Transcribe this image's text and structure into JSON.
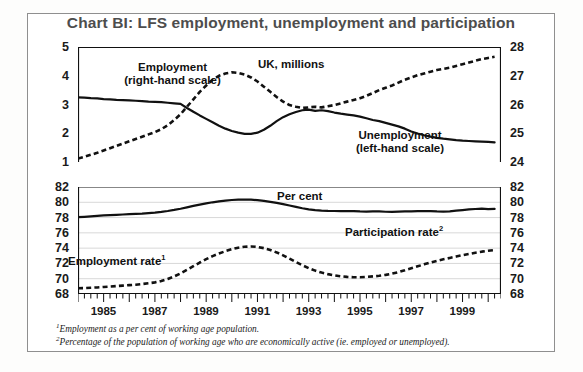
{
  "chart_title": "Chart BI: LFS employment, unemployment and participation",
  "panels": {
    "top": {
      "unit_label": "UK, millions",
      "series_labels": {
        "employment_line1": "Employment",
        "employment_line2": "(right-hand scale)",
        "unemployment_line1": "Unemployment",
        "unemployment_line2": "(left-hand scale)"
      },
      "left_ticks": [
        "5",
        "4",
        "3",
        "2",
        "1"
      ],
      "right_ticks": [
        "28",
        "27",
        "26",
        "25",
        "24"
      ]
    },
    "bottom": {
      "unit_label": "Per cent",
      "series_labels": {
        "participation": "Participation rate",
        "participation_sup": "2",
        "employment_rate": "Employment rate",
        "employment_rate_sup": "1"
      },
      "left_ticks": [
        "82",
        "80",
        "78",
        "76",
        "74",
        "72",
        "70",
        "68"
      ],
      "right_ticks": [
        "82",
        "80",
        "78",
        "76",
        "74",
        "72",
        "70",
        "68"
      ]
    }
  },
  "x_axis": {
    "tick_labels": [
      "1985",
      "1987",
      "1989",
      "1991",
      "1993",
      "1995",
      "1997",
      "1999"
    ],
    "range_start": 1984.0,
    "range_end": 2000.5,
    "minor_tick_interval_years": 0.25
  },
  "footnotes": [
    {
      "marker": "1",
      "text": "Employment as a per cent of working age population."
    },
    {
      "marker": "2",
      "text": "Percentage of the population of working age who are economically active (ie. employed or unemployed)."
    }
  ],
  "colors": {
    "line": "#111111",
    "frame": "#8f8f8f",
    "grid": "#d8d8d8",
    "title": "#4d4d4d",
    "background": "#ffffff"
  },
  "chart_data": [
    {
      "type": "line",
      "title": "LFS unemployment and employment (UK, millions)",
      "xlabel": "",
      "ylabel": "UK, millions",
      "ylim": [
        1,
        5
      ],
      "y2lim": [
        24,
        28
      ],
      "grid": false,
      "legend": "inline annotations",
      "x": [
        1984.0,
        1984.25,
        1984.5,
        1984.75,
        1985.0,
        1985.25,
        1985.5,
        1985.75,
        1986.0,
        1986.25,
        1986.5,
        1986.75,
        1987.0,
        1987.25,
        1987.5,
        1987.75,
        1988.0,
        1988.25,
        1988.5,
        1988.75,
        1989.0,
        1989.25,
        1989.5,
        1989.75,
        1990.0,
        1990.25,
        1990.5,
        1990.75,
        1991.0,
        1991.25,
        1991.5,
        1991.75,
        1992.0,
        1992.25,
        1992.5,
        1992.75,
        1993.0,
        1993.25,
        1993.5,
        1993.75,
        1994.0,
        1994.25,
        1994.5,
        1994.75,
        1995.0,
        1995.25,
        1995.5,
        1995.75,
        1996.0,
        1996.25,
        1996.5,
        1996.75,
        1997.0,
        1997.25,
        1997.5,
        1997.75,
        1998.0,
        1998.25,
        1998.5,
        1998.75,
        1999.0,
        1999.25,
        1999.5,
        1999.75,
        2000.0,
        2000.25
      ],
      "series": [
        {
          "name": "Unemployment (left-hand scale)",
          "style": "solid",
          "axis": "left",
          "units": "millions",
          "values": [
            3.25,
            3.24,
            3.22,
            3.21,
            3.19,
            3.18,
            3.16,
            3.15,
            3.14,
            3.13,
            3.12,
            3.1,
            3.09,
            3.08,
            3.06,
            3.04,
            3.02,
            2.88,
            2.75,
            2.62,
            2.5,
            2.38,
            2.26,
            2.16,
            2.08,
            2.02,
            1.98,
            1.98,
            2.02,
            2.12,
            2.26,
            2.42,
            2.56,
            2.66,
            2.74,
            2.8,
            2.82,
            2.78,
            2.8,
            2.77,
            2.72,
            2.68,
            2.65,
            2.62,
            2.58,
            2.52,
            2.46,
            2.42,
            2.36,
            2.3,
            2.24,
            2.16,
            2.06,
            1.99,
            1.93,
            1.88,
            1.84,
            1.81,
            1.79,
            1.76,
            1.74,
            1.73,
            1.72,
            1.71,
            1.7,
            1.68
          ]
        },
        {
          "name": "Employment (right-hand scale)",
          "style": "dashed",
          "axis": "right",
          "units": "millions",
          "values": [
            24.12,
            24.18,
            24.25,
            24.32,
            24.4,
            24.48,
            24.56,
            24.64,
            24.72,
            24.8,
            24.88,
            24.96,
            25.04,
            25.14,
            25.28,
            25.46,
            25.66,
            25.92,
            26.18,
            26.44,
            26.66,
            26.86,
            27.0,
            27.08,
            27.12,
            27.1,
            27.04,
            26.94,
            26.8,
            26.62,
            26.44,
            26.26,
            26.1,
            25.98,
            25.92,
            25.88,
            25.9,
            25.92,
            25.9,
            25.94,
            25.98,
            26.04,
            26.1,
            26.16,
            26.22,
            26.3,
            26.4,
            26.5,
            26.58,
            26.66,
            26.76,
            26.86,
            26.94,
            27.02,
            27.08,
            27.14,
            27.2,
            27.24,
            27.28,
            27.34,
            27.4,
            27.46,
            27.52,
            27.58,
            27.62,
            27.66
          ]
        }
      ]
    },
    {
      "type": "line",
      "title": "Employment rate and participation rate (per cent)",
      "xlabel": "",
      "ylabel": "Per cent",
      "ylim": [
        68,
        82
      ],
      "y2lim": [
        68,
        82
      ],
      "grid": true,
      "legend": "inline annotations",
      "x": [
        1984.0,
        1984.25,
        1984.5,
        1984.75,
        1985.0,
        1985.25,
        1985.5,
        1985.75,
        1986.0,
        1986.25,
        1986.5,
        1986.75,
        1987.0,
        1987.25,
        1987.5,
        1987.75,
        1988.0,
        1988.25,
        1988.5,
        1988.75,
        1989.0,
        1989.25,
        1989.5,
        1989.75,
        1990.0,
        1990.25,
        1990.5,
        1990.75,
        1991.0,
        1991.25,
        1991.5,
        1991.75,
        1992.0,
        1992.25,
        1992.5,
        1992.75,
        1993.0,
        1993.25,
        1993.5,
        1993.75,
        1994.0,
        1994.25,
        1994.5,
        1994.75,
        1995.0,
        1995.25,
        1995.5,
        1995.75,
        1996.0,
        1996.25,
        1996.5,
        1996.75,
        1997.0,
        1997.25,
        1997.5,
        1997.75,
        1998.0,
        1998.25,
        1998.5,
        1998.75,
        1999.0,
        1999.25,
        1999.5,
        1999.75,
        2000.0,
        2000.25
      ],
      "series": [
        {
          "name": "Participation rate",
          "style": "solid",
          "axis": "left",
          "units": "per cent",
          "values": [
            78.05,
            78.1,
            78.16,
            78.22,
            78.28,
            78.32,
            78.36,
            78.4,
            78.44,
            78.48,
            78.52,
            78.58,
            78.64,
            78.74,
            78.86,
            79.0,
            79.16,
            79.34,
            79.52,
            79.7,
            79.86,
            80.0,
            80.12,
            80.22,
            80.3,
            80.34,
            80.36,
            80.34,
            80.28,
            80.18,
            80.06,
            79.92,
            79.76,
            79.58,
            79.4,
            79.22,
            79.08,
            78.98,
            78.92,
            78.88,
            78.86,
            78.84,
            78.86,
            78.84,
            78.8,
            78.78,
            78.82,
            78.8,
            78.76,
            78.74,
            78.78,
            78.8,
            78.82,
            78.84,
            78.86,
            78.84,
            78.8,
            78.78,
            78.82,
            78.9,
            78.98,
            79.06,
            79.12,
            79.16,
            79.1,
            79.14
          ]
        },
        {
          "name": "Employment rate",
          "style": "dashed",
          "axis": "left",
          "units": "per cent",
          "values": [
            68.75,
            68.78,
            68.82,
            68.86,
            68.92,
            68.98,
            69.04,
            69.1,
            69.16,
            69.22,
            69.3,
            69.4,
            69.52,
            69.7,
            69.96,
            70.3,
            70.7,
            71.16,
            71.64,
            72.12,
            72.56,
            72.96,
            73.3,
            73.6,
            73.86,
            74.06,
            74.18,
            74.22,
            74.16,
            74.0,
            73.76,
            73.44,
            73.06,
            72.62,
            72.18,
            71.76,
            71.38,
            71.06,
            70.8,
            70.6,
            70.44,
            70.32,
            70.24,
            70.2,
            70.2,
            70.24,
            70.3,
            70.38,
            70.5,
            70.66,
            70.86,
            71.1,
            71.36,
            71.62,
            71.88,
            72.12,
            72.34,
            72.54,
            72.72,
            72.9,
            73.08,
            73.24,
            73.4,
            73.54,
            73.66,
            73.76
          ]
        }
      ]
    }
  ]
}
